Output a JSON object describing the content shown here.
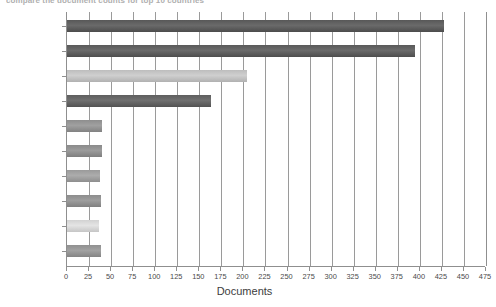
{
  "header": {
    "cut_title": "compare the document counts for top 10 countries"
  },
  "chart_data": {
    "type": "bar",
    "orientation": "horizontal",
    "title": "",
    "xlabel": "Documents",
    "ylabel": "",
    "xlim": [
      0,
      475
    ],
    "xtick_step": 25,
    "grid": true,
    "legend": "none",
    "categories": [
      "United States",
      "China",
      "Japan",
      "South Korea",
      "France",
      "United Kingdom",
      "Canada",
      "Australia",
      "Spain",
      "Germany"
    ],
    "values": [
      427,
      394,
      204,
      163,
      40,
      40,
      37,
      38,
      36,
      38
    ],
    "xticklabels": [
      "0",
      "25",
      "50",
      "75",
      "100",
      "125",
      "150",
      "175",
      "200",
      "225",
      "250",
      "275",
      "300",
      "325",
      "350",
      "375",
      "400",
      "425",
      "450",
      "475"
    ],
    "bar_colors": [
      "#585858",
      "#595959",
      "#bdbdbd",
      "#5e5e5e",
      "#8e8e8e",
      "#8a8a8a",
      "#9a9a9a",
      "#8c8c8c",
      "#d2d2d2",
      "#909090"
    ]
  },
  "style": {
    "axis_color": "#8f8f8f",
    "grid_color": "#9a9a9a",
    "text_color": "#4a4a4a",
    "background": "#ffffff"
  }
}
